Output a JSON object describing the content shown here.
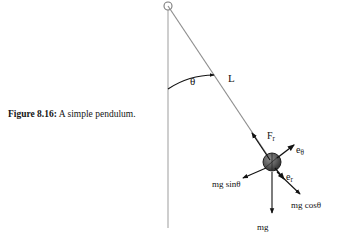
{
  "figure": {
    "caption_label": "Figure 8.16:",
    "caption_text": "A simple pendulum.",
    "background_color": "#ffffff",
    "ink_color": "#121212",
    "string_color": "#8a8a8a",
    "axis_color": "#b0b0b0",
    "bob_color": "#5a5a5a"
  },
  "labels": {
    "angle": "θ",
    "length": "L",
    "tension": "F",
    "tension_sub": "r",
    "unit_theta": "e",
    "unit_theta_sub": "θ",
    "unit_r": "e",
    "unit_r_sub": "r",
    "mg_sin": "mg sinθ",
    "mg_cos": "mg cosθ",
    "weight": "mg"
  },
  "geometry": {
    "pivot": {
      "x": 168,
      "y": 6,
      "radius": 4
    },
    "bob": {
      "x": 272,
      "y": 162,
      "radius": 9
    },
    "vertical_line": {
      "x": 168,
      "y_top": 6,
      "y_bottom": 228
    },
    "string": {
      "x1": 168,
      "y1": 6,
      "x2": 272,
      "y2": 162
    },
    "angle_arc_degrees": 33.7,
    "label_positions": {
      "angle": {
        "x": 190,
        "y": 76
      },
      "length": {
        "x": 228,
        "y": 73
      },
      "tension": {
        "x": 267,
        "y": 131
      },
      "unit_theta": {
        "x": 296,
        "y": 145
      },
      "unit_r": {
        "x": 286,
        "y": 172
      },
      "mg_sin": {
        "x": 212,
        "y": 180
      },
      "mg_cos": {
        "x": 291,
        "y": 201
      },
      "weight": {
        "x": 257,
        "y": 223
      }
    }
  }
}
